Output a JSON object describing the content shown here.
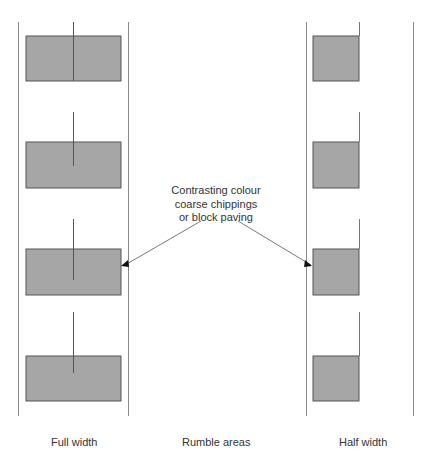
{
  "diagram": {
    "callout": {
      "lines": [
        "Contrasting colour",
        "coarse chippings",
        "or block paving"
      ]
    },
    "labels": {
      "full_width": "Full width",
      "rumble_areas": "Rumble areas",
      "half_width": "Half width"
    },
    "colors": {
      "fill": "#a6a6a6",
      "stroke": "#555555",
      "edge_line": "#888888",
      "text": "#333333"
    },
    "full_width_panel": {
      "edge_lines_x": [
        18,
        128
      ],
      "centre_line_x": 73,
      "rumble_areas": [
        {
          "x": 26,
          "y": 36,
          "w": 95,
          "h": 45
        },
        {
          "x": 26,
          "y": 142,
          "w": 95,
          "h": 46
        },
        {
          "x": 26,
          "y": 249,
          "w": 95,
          "h": 46
        },
        {
          "x": 26,
          "y": 356,
          "w": 95,
          "h": 45
        }
      ]
    },
    "half_width_panel": {
      "edge_lines_x": [
        306,
        413
      ],
      "centre_line_x": 359,
      "rumble_areas": [
        {
          "x": 313,
          "y": 36,
          "w": 46,
          "h": 45
        },
        {
          "x": 313,
          "y": 142,
          "w": 46,
          "h": 46
        },
        {
          "x": 313,
          "y": 249,
          "w": 46,
          "h": 46
        },
        {
          "x": 313,
          "y": 356,
          "w": 46,
          "h": 45
        }
      ]
    }
  }
}
